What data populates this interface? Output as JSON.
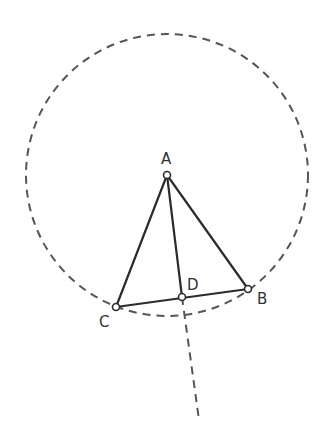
{
  "diagram": {
    "type": "geometry-construction",
    "colors": {
      "stroke": "#2b2b2b",
      "dashed": "#555555",
      "point_fill": "#ffffff",
      "label": "#333333"
    },
    "circle": {
      "cx": 167,
      "cy": 175,
      "r": 141,
      "style": "dashed"
    },
    "points": [
      {
        "id": "A",
        "label": "A",
        "x": 167,
        "y": 175,
        "lx": 161,
        "ly": 164
      },
      {
        "id": "B",
        "label": "B",
        "x": 248,
        "y": 289,
        "lx": 257,
        "ly": 304
      },
      {
        "id": "C",
        "label": "C",
        "x": 116,
        "y": 307,
        "lx": 99,
        "ly": 327
      },
      {
        "id": "D",
        "label": "D",
        "x": 182,
        "y": 297,
        "lx": 187,
        "ly": 290
      }
    ],
    "segments": [
      {
        "from": "A",
        "to": "B",
        "style": "solid"
      },
      {
        "from": "A",
        "to": "C",
        "style": "solid"
      },
      {
        "from": "B",
        "to": "C",
        "style": "solid"
      },
      {
        "from": "A",
        "to": "D",
        "style": "solid"
      }
    ],
    "rays": [
      {
        "from": "D",
        "to_x": 199,
        "to_y": 420,
        "style": "dashed"
      }
    ]
  }
}
